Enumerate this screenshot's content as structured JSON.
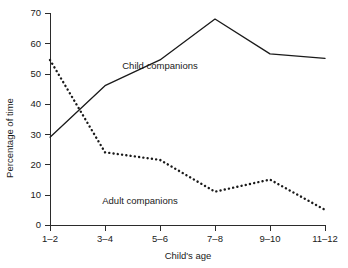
{
  "chart_data": {
    "type": "line",
    "title": "",
    "xlabel": "Child's age",
    "ylabel": "Percentage of time",
    "categories": [
      "1–2",
      "3–4",
      "5–6",
      "7–8",
      "9–10",
      "11–12"
    ],
    "ylim": [
      0,
      70
    ],
    "yticks": [
      0,
      10,
      20,
      30,
      40,
      50,
      60,
      70
    ],
    "ytick_labels": [
      "0",
      "10",
      "20",
      "30",
      "40",
      "50",
      "60",
      "70"
    ],
    "grid": false,
    "legend_position": "inline-annotations",
    "series": [
      {
        "name": "Child companions",
        "style": "solid",
        "color": "#1a1a1a",
        "values": [
          29,
          46,
          54.5,
          68,
          56.5,
          55
        ]
      },
      {
        "name": "Adult companions",
        "style": "dotted",
        "color": "#1a1a1a",
        "values": [
          54.5,
          24,
          21.5,
          11,
          15,
          5
        ]
      }
    ],
    "annotations": [
      {
        "text": "Child companions",
        "series": "Child companions",
        "x": 160,
        "y": 69
      },
      {
        "text": "Adult companions",
        "series": "Adult companions",
        "x": 140,
        "y": 204
      }
    ]
  }
}
